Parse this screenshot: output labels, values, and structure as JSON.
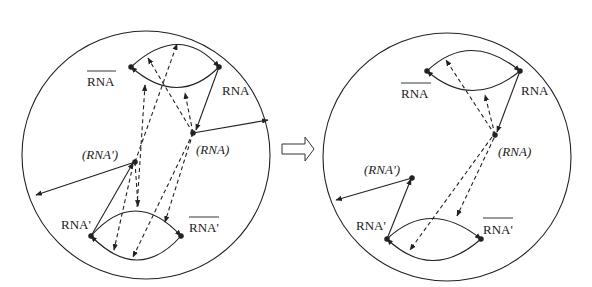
{
  "diagram": {
    "left_panel": {
      "labels": {
        "rna_bar": "RNA",
        "rna": "RNA",
        "rna_paren": "(RNA)",
        "rna_prime_paren": "(RNA')",
        "rna_prime": "RNA'",
        "rna_prime_bar": "RNA'"
      }
    },
    "transition_arrow": "hollow-right-arrow",
    "right_panel": {
      "labels": {
        "rna_bar": "RNA",
        "rna": "RNA",
        "rna_paren": "(RNA)",
        "rna_prime_paren": "(RNA')",
        "rna_prime": "RNA'",
        "rna_prime_bar": "RNA'"
      }
    },
    "colors": {
      "line": "#222222",
      "background": "#ffffff"
    }
  }
}
